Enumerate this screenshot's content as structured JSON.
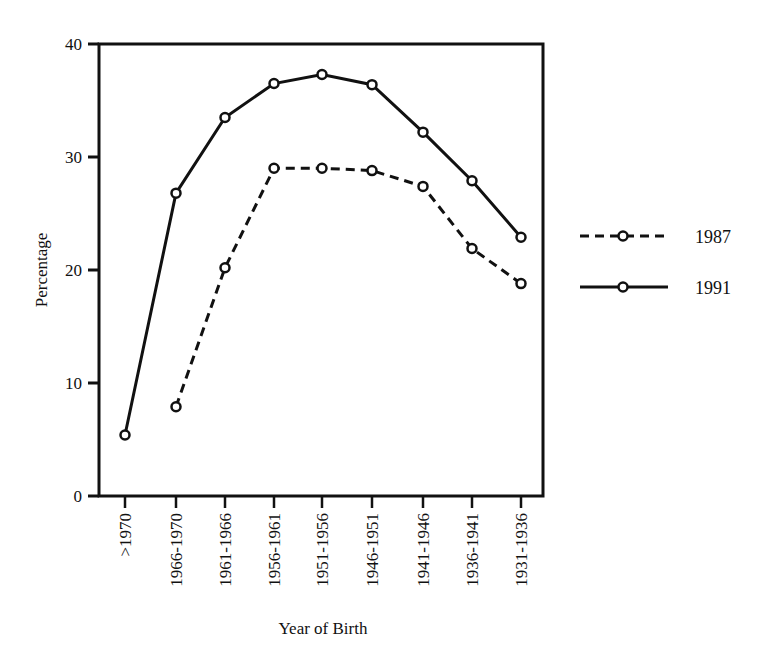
{
  "chart_data": {
    "type": "line",
    "title": "",
    "xlabel": "Year of Birth",
    "ylabel": "Percentage",
    "ylim": [
      0,
      40
    ],
    "yticks": [
      0,
      10,
      20,
      30,
      40
    ],
    "grid": false,
    "legend_position": "right",
    "categories": [
      ">1970",
      "1966-1970",
      "1961-1966",
      "1956-1961",
      "1951-1956",
      "1946-1951",
      "1941-1946",
      "1936-1941",
      "1931-1936"
    ],
    "series": [
      {
        "name": "1987",
        "style": "dashed",
        "values": [
          null,
          7.9,
          20.2,
          29.0,
          29.0,
          28.8,
          27.4,
          21.9,
          18.8
        ]
      },
      {
        "name": "1991",
        "style": "solid",
        "values": [
          5.4,
          26.8,
          33.5,
          36.5,
          37.3,
          36.4,
          32.2,
          27.9,
          22.9
        ]
      }
    ]
  },
  "colors": {
    "line": "#111111",
    "background": "#ffffff"
  }
}
